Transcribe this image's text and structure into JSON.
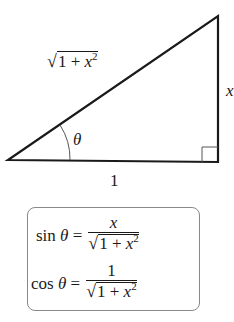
{
  "diagram": {
    "type": "right-triangle",
    "hypotenuse_label": {
      "radical": "√",
      "radicand_base": "1 + x",
      "exponent": "2"
    },
    "opposite_label": "x",
    "adjacent_label": "1",
    "angle_label": "θ",
    "right_angle_marker": true
  },
  "formulas": [
    {
      "lhs": "sin θ =",
      "numerator": "x",
      "denominator": {
        "radical": "√",
        "radicand_base": "1 + x",
        "exponent": "2"
      }
    },
    {
      "lhs": "cos θ =",
      "numerator": "1",
      "denominator": {
        "radical": "√",
        "radicand_base": "1 + x",
        "exponent": "2"
      }
    }
  ]
}
